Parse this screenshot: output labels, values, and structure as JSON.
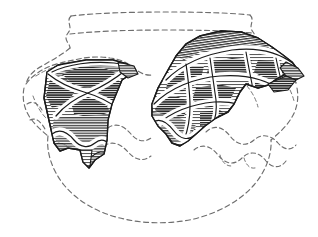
{
  "figure": {
    "type": "archaeological-pottery-illustration",
    "caption": "",
    "background_color": "#ffffff",
    "ink_color": "#1a1a1a",
    "reconstruction_line_color": "#6e6e6e",
    "hatch_color": "#4a4a4a",
    "fill_gray": "#8a8a8a",
    "fill_gray_dark": "#6a6a6a",
    "fill_gray_light": "#b4b4b4",
    "cordon_highlight_color": "#ffffff"
  },
  "vessel": {
    "name": "globular jar with everted rim",
    "rim_label": "rim",
    "neck_label": "neck",
    "shoulder_label": "shoulder",
    "body_label": "body",
    "base_label": "base",
    "reconstruction_style": "dashed",
    "extant_style": "solid hatched"
  },
  "sherds": [
    {
      "id": "sherd-left",
      "label": "left sherd",
      "decoration": "applied cross / saltire cordon with hatched panels",
      "position": "shoulder, left of centre",
      "cell_count": 4
    },
    {
      "id": "sherd-right",
      "label": "right sherd",
      "decoration": "applied lattice cordon forming lozenge cells, with horned projection at right break",
      "position": "shoulder to upper body, right of centre",
      "cell_count": 8
    }
  ],
  "features": [
    {
      "id": "rim-line",
      "label": "reconstructed rim outline"
    },
    {
      "id": "neck-line",
      "label": "reconstructed neck base line"
    },
    {
      "id": "body-outline",
      "label": "reconstructed body and base profile"
    },
    {
      "id": "wavy-cordon",
      "label": "reconstructed wavy cordon band"
    },
    {
      "id": "cordon-band",
      "label": "surviving wavy cordon moulding on sherds"
    }
  ]
}
